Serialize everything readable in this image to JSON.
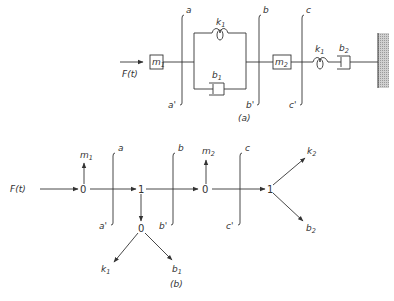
{
  "figure_a": {
    "caption": "(a)",
    "force_label": "F(t)",
    "mass1": {
      "sym": "m",
      "sub": "1"
    },
    "mass2": {
      "sym": "m",
      "sub": "2"
    },
    "spring1": {
      "sym": "k",
      "sub": "1"
    },
    "damper1": {
      "sym": "b",
      "sub": "1"
    },
    "spring2": {
      "sym": "k",
      "sub": "1"
    },
    "damper2": {
      "sym": "b",
      "sub": "2"
    },
    "cuts": [
      {
        "top": "a",
        "bottom": "a'"
      },
      {
        "top": "b",
        "bottom": "b'"
      },
      {
        "top": "c",
        "bottom": "c'"
      }
    ],
    "wall": "fixed-wall"
  },
  "figure_b": {
    "caption": "(b)",
    "source_label": "F(t)",
    "junctions": [
      "0",
      "1",
      "0",
      "0",
      "1"
    ],
    "m1": {
      "sym": "m",
      "sub": "1"
    },
    "m2": {
      "sym": "m",
      "sub": "2"
    },
    "k1": {
      "sym": "k",
      "sub": "1"
    },
    "b1": {
      "sym": "b",
      "sub": "1"
    },
    "k2": {
      "sym": "k",
      "sub": "2"
    },
    "b2": {
      "sym": "b",
      "sub": "2"
    },
    "cuts": [
      {
        "top": "a",
        "bottom": "a'"
      },
      {
        "top": "b",
        "bottom": "b'"
      },
      {
        "top": "c",
        "bottom": "c'"
      }
    ]
  },
  "colors": {
    "ink": "#333333",
    "wall": "#bdbdbd",
    "background": "#ffffff"
  }
}
